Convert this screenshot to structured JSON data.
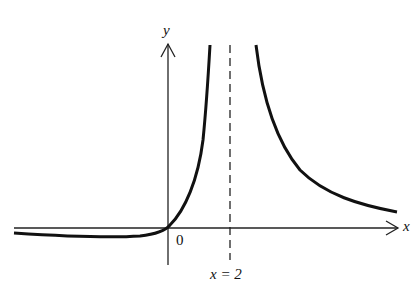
{
  "figure": {
    "y_axis_label": "y",
    "x_axis_label": "x",
    "origin_label": "0",
    "asymptote_label": "x = 2",
    "asymptote_x": 2,
    "curve_color": "#111111",
    "axis_color": "#222222"
  }
}
